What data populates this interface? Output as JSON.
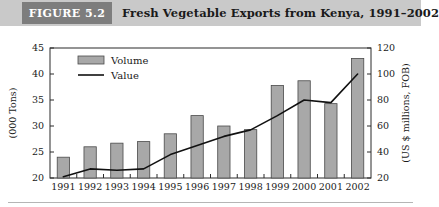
{
  "header": {
    "badge_label": "FIGURE 5.2",
    "title": "Fresh Vegetable Exports from Kenya, 1991–2002",
    "badge_color": "#7d7d7d",
    "band_color": "#c9c9c9"
  },
  "legend": {
    "position": "top-left-inside",
    "entries": [
      {
        "label": "Volume",
        "marker": "filled-rect",
        "color": "#a8a8a8"
      },
      {
        "label": "Value",
        "marker": "line",
        "color": "#111111"
      }
    ]
  },
  "chart_data": {
    "type": "bar",
    "title": "Fresh Vegetable Exports from Kenya, 1991–2002",
    "xlabel": "",
    "ylabel": "(000 Tons)",
    "y2label": "(US $ millions, FOB)",
    "categories": [
      "1991",
      "1992",
      "1993",
      "1994",
      "1995",
      "1996",
      "1997",
      "1998",
      "1999",
      "2000",
      "2001",
      "2002"
    ],
    "ylim": [
      20,
      45
    ],
    "yticks": [
      20,
      25,
      30,
      35,
      40,
      45
    ],
    "y2lim": [
      20,
      120
    ],
    "y2ticks": [
      20,
      40,
      60,
      80,
      100,
      120
    ],
    "grid": false,
    "series": [
      {
        "name": "Volume",
        "type": "bar",
        "axis": "left",
        "unit": "000 Tons",
        "color": "#a8a8a8",
        "values": [
          24.0,
          26.0,
          26.7,
          27.0,
          28.5,
          32.0,
          30.0,
          29.3,
          37.8,
          38.7,
          34.3,
          43.0
        ]
      },
      {
        "name": "Value",
        "type": "line",
        "axis": "right",
        "unit": "US $ millions, FOB",
        "color": "#111111",
        "values": [
          21,
          27,
          26,
          27,
          38,
          45,
          52,
          57,
          68,
          80,
          78,
          100
        ]
      }
    ]
  }
}
